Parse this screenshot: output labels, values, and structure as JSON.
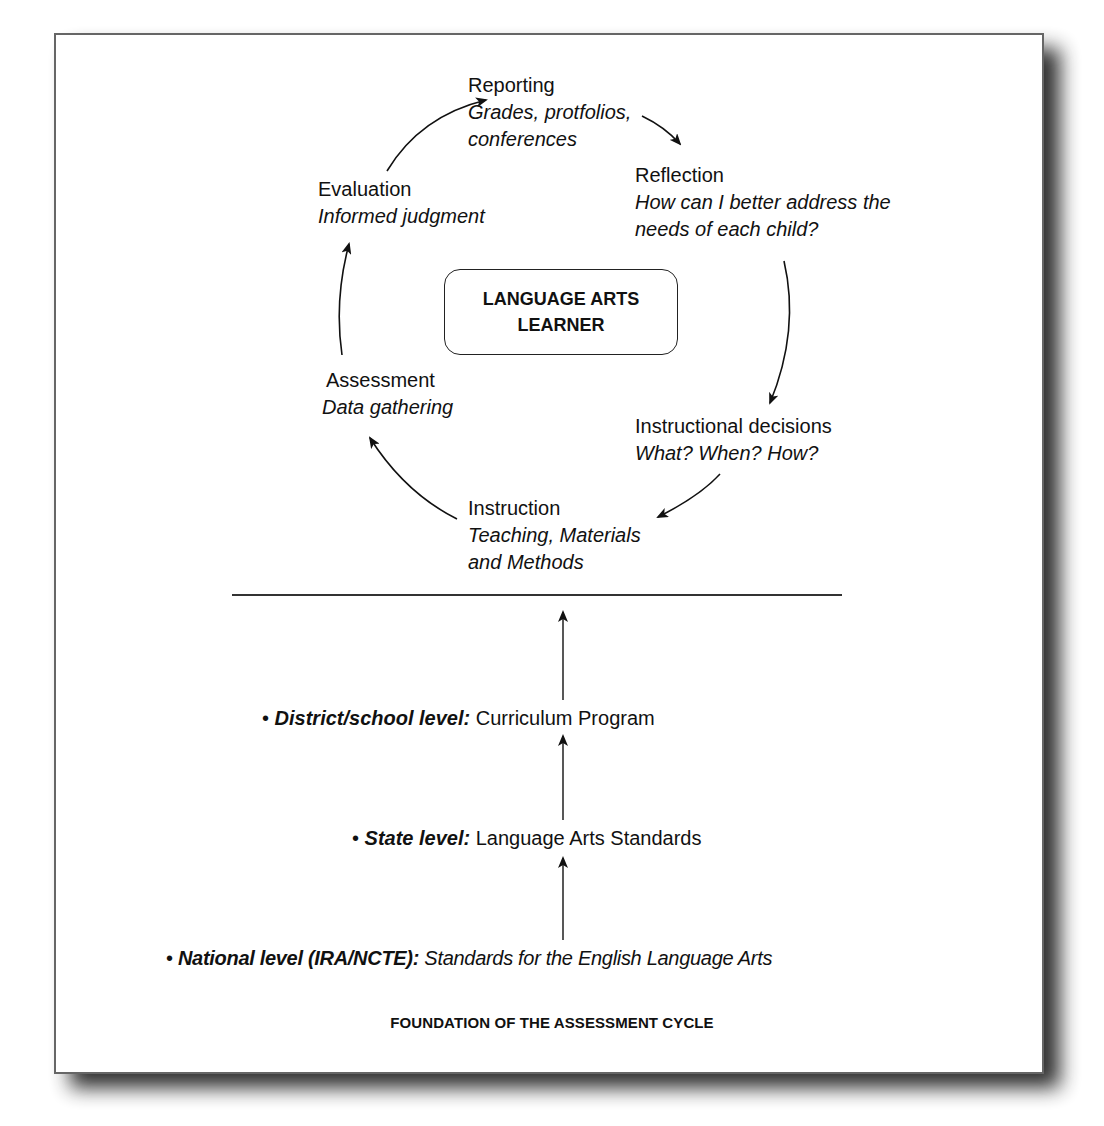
{
  "cycle": {
    "center": {
      "line1": "LANGUAGE ARTS",
      "line2": "LEARNER"
    },
    "stages": {
      "reporting": {
        "title": "Reporting",
        "detail_line1": "Grades, protfolios,",
        "detail_line2": "conferences"
      },
      "reflection": {
        "title": "Reflection",
        "detail_line1": "How can I better address the",
        "detail_line2": "needs of each child?"
      },
      "instructional_decisions": {
        "title": "Instructional decisions",
        "detail_line1": "What? When? How?"
      },
      "instruction": {
        "title": "Instruction",
        "detail_line1": "Teaching, Materials",
        "detail_line2": "and Methods"
      },
      "assessment": {
        "title": "Assessment",
        "detail_line1": "Data gathering"
      },
      "evaluation": {
        "title": "Evaluation",
        "detail_line1": "Informed judgment"
      }
    },
    "flow_order": [
      "Evaluation",
      "Reporting",
      "Reflection",
      "Instructional decisions",
      "Instruction",
      "Assessment",
      "Evaluation"
    ]
  },
  "foundation": {
    "levels": [
      {
        "bullet": "•",
        "key": "District/school level:",
        "value": "Curriculum Program"
      },
      {
        "bullet": "•",
        "key": "State level:",
        "value": "Language Arts Standards"
      },
      {
        "bullet": "•",
        "key": "National level (IRA/NCTE):",
        "value": "Standards for the English Language Arts"
      }
    ],
    "caption": "FOUNDATION OF THE ASSESSMENT CYCLE"
  },
  "colors": {
    "frame_border": "#666666",
    "text": "#111111",
    "shadow": "#1a1a1a"
  }
}
